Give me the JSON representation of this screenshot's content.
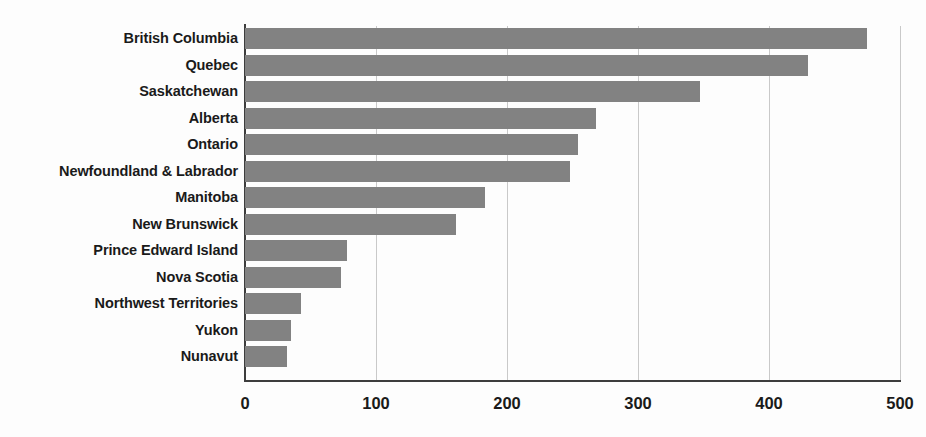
{
  "chart_data": {
    "type": "bar",
    "orientation": "horizontal",
    "title": "",
    "subtitle": "",
    "xlabel": "",
    "ylabel": "",
    "categories": [
      "British Columbia",
      "Quebec",
      "Saskatchewan",
      "Alberta",
      "Ontario",
      "Newfoundland & Labrador",
      "Manitoba",
      "New Brunswick",
      "Prince Edward Island",
      "Nova Scotia",
      "Northwest Territories",
      "Yukon",
      "Nunavut"
    ],
    "values": [
      475,
      430,
      347,
      268,
      254,
      248,
      183,
      161,
      78,
      73,
      43,
      35,
      32
    ],
    "xlim": [
      0,
      500
    ],
    "xticks": [
      0,
      100,
      200,
      300,
      400,
      500
    ],
    "xtick_labels": [
      "0",
      "100",
      "200",
      "300",
      "400",
      "500"
    ],
    "grid": true,
    "grid_axis": "x",
    "legend": false,
    "legend_position": "none",
    "bar_color": "#828282",
    "axis_color": "#3d3d3d",
    "grid_color": "#c9c9c9",
    "label_color": "#1a1a1a",
    "background_color": "#fdfdfd"
  }
}
